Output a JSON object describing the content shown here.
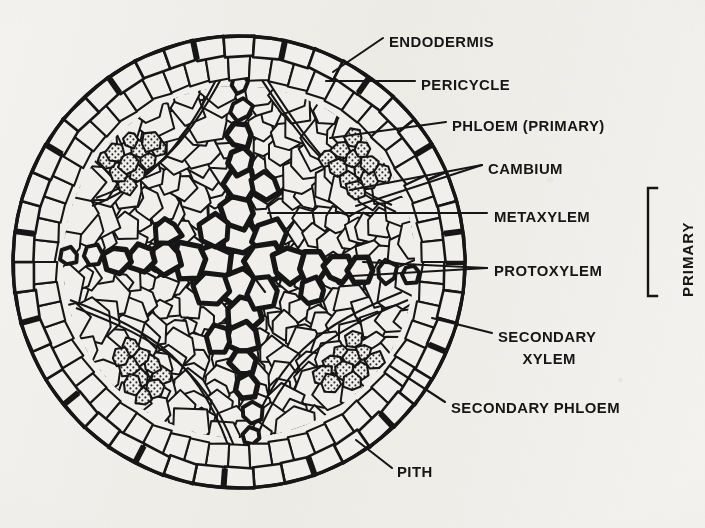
{
  "figure": {
    "kind": "botanical-cross-section-diagram",
    "ghost_text_top": "",
    "colors": {
      "paper": "#f3f2ef",
      "ink": "#161616",
      "cell_fill": "#f0efeb",
      "stipple": "#2b2b2b"
    }
  },
  "labels": [
    {
      "id": "endodermis",
      "text": "ENDODERMIS",
      "x": 389,
      "y": 43,
      "align": "left"
    },
    {
      "id": "pericycle",
      "text": "PERICYCLE",
      "x": 421,
      "y": 86,
      "align": "left"
    },
    {
      "id": "phloem-primary",
      "text": "PHLOEM  (PRIMARY)",
      "x": 452,
      "y": 127,
      "align": "left"
    },
    {
      "id": "cambium",
      "text": "CAMBIUM",
      "x": 488,
      "y": 170,
      "align": "left"
    },
    {
      "id": "metaxylem",
      "text": "METAXYLEM",
      "x": 494,
      "y": 218,
      "align": "left"
    },
    {
      "id": "protoxylem",
      "text": "PROTOXYLEM",
      "x": 494,
      "y": 272,
      "align": "left"
    },
    {
      "id": "secondary-xylem-1",
      "text": "SECONDARY",
      "x": 498,
      "y": 338,
      "align": "left"
    },
    {
      "id": "secondary-xylem-2",
      "text": "XYLEM",
      "x": 548,
      "y": 360,
      "align": "center"
    },
    {
      "id": "secondary-phloem",
      "text": "SECONDARY PHLOEM",
      "x": 451,
      "y": 409,
      "align": "left"
    },
    {
      "id": "pith",
      "text": "PITH",
      "x": 397,
      "y": 473,
      "align": "left"
    }
  ],
  "bracket": {
    "id": "primary-bracket",
    "label": "PRIMARY",
    "x": 648,
    "y_top": 188,
    "y_bottom": 296,
    "label_x": 679,
    "label_y": 297
  },
  "regions": [
    {
      "id": "endodermis",
      "description": "outer single ring of barrel cells with dark casparian strips"
    },
    {
      "id": "pericycle",
      "description": "layer of cells just inside endodermis"
    },
    {
      "id": "primary-phloem",
      "description": "stippled cell clusters between xylem arms"
    },
    {
      "id": "cambium",
      "description": "thin arcs of flattened cells between xylem and phloem"
    },
    {
      "id": "metaxylem",
      "description": "large thick-walled vessels near centre of xylem arms"
    },
    {
      "id": "protoxylem",
      "description": "small thick-walled vessels at the tips of xylem arms"
    },
    {
      "id": "secondary-xylem",
      "description": "files of cells inside the cambium arcs"
    },
    {
      "id": "secondary-phloem",
      "description": "cells outside the cambium arcs"
    },
    {
      "id": "pith",
      "description": "central parenchyma region"
    }
  ],
  "circle": {
    "cx": 239,
    "cy": 262,
    "r": 228
  }
}
